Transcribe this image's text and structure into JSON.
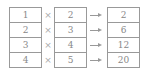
{
  "left": [
    "1",
    "2",
    "3",
    "4"
  ],
  "operator": "×",
  "middle": [
    "2",
    "3",
    "4",
    "5"
  ],
  "right": [
    "2",
    "6",
    "12",
    "20"
  ]
}
